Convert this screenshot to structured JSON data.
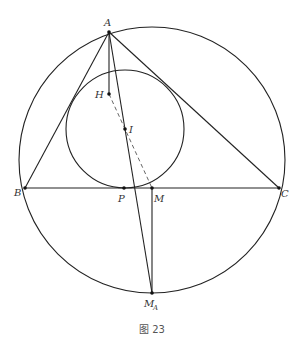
{
  "figure": {
    "caption": "图 23",
    "colors": {
      "stroke": "#222222",
      "text": "#333333",
      "background": "#ffffff"
    },
    "points": {
      "A": {
        "label": "A",
        "x": 109,
        "y": 32
      },
      "B": {
        "label": "B",
        "x": 25,
        "y": 188
      },
      "C": {
        "label": "C",
        "x": 279,
        "y": 188
      },
      "H": {
        "label": "H",
        "x": 109,
        "y": 94
      },
      "I": {
        "label": "I",
        "x": 125,
        "y": 129
      },
      "P": {
        "label": "P",
        "x": 124,
        "y": 188
      },
      "M": {
        "label": "M",
        "x": 152,
        "y": 188
      },
      "MA": {
        "label": "M",
        "subscript": "A",
        "x": 152,
        "y": 293
      }
    },
    "circles": {
      "circumcircle": {
        "cx": 152,
        "cy": 160,
        "r": 133
      },
      "incircle": {
        "cx": 125,
        "cy": 129,
        "r": 59
      }
    },
    "segments": [
      {
        "from": "A",
        "to": "B",
        "style": "solid"
      },
      {
        "from": "A",
        "to": "C",
        "style": "solid"
      },
      {
        "from": "B",
        "to": "C",
        "style": "solid"
      },
      {
        "from": "A",
        "to": "H",
        "style": "solid"
      },
      {
        "from": "A",
        "to": "MA",
        "style": "solid"
      },
      {
        "from": "M",
        "to": "MA",
        "style": "solid"
      },
      {
        "from": "H",
        "to": "M",
        "style": "dashed"
      }
    ]
  }
}
